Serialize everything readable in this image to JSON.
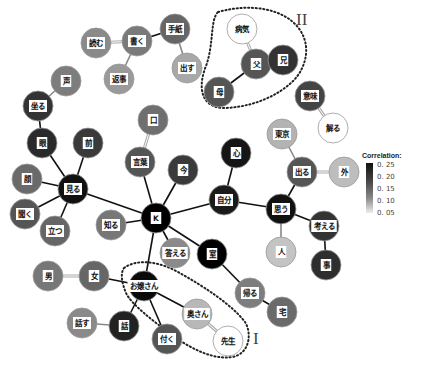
{
  "diagram": {
    "type": "co-occurrence network",
    "nodes": [
      {
        "id": "yomu",
        "label": "読む",
        "x": 96,
        "y": 43,
        "r": 15,
        "fill": "#8a8a8a"
      },
      {
        "id": "kaku",
        "label": "書く",
        "x": 137,
        "y": 41,
        "r": 15,
        "fill": "#7a7a7a"
      },
      {
        "id": "tegami",
        "label": "手紙",
        "x": 175,
        "y": 29,
        "r": 15,
        "fill": "#666"
      },
      {
        "id": "dasu",
        "label": "出す",
        "x": 187,
        "y": 68,
        "r": 15,
        "fill": "#a8a8a8"
      },
      {
        "id": "henji",
        "label": "返事",
        "x": 119,
        "y": 79,
        "r": 15,
        "fill": "#9a9a9a"
      },
      {
        "id": "koe",
        "label": "声",
        "x": 66,
        "y": 81,
        "r": 15,
        "fill": "#7d7d7d"
      },
      {
        "id": "suwaru",
        "label": "坐る",
        "x": 38,
        "y": 106,
        "r": 15,
        "fill": "#333"
      },
      {
        "id": "me",
        "label": "眼",
        "x": 42,
        "y": 143,
        "r": 15,
        "fill": "#2a2a2a"
      },
      {
        "id": "mae",
        "label": "前",
        "x": 88,
        "y": 143,
        "r": 15,
        "fill": "#3a3a3a"
      },
      {
        "id": "kao",
        "label": "顔",
        "x": 27,
        "y": 179,
        "r": 15,
        "fill": "#6a6a6a"
      },
      {
        "id": "miru",
        "label": "見る",
        "x": 73,
        "y": 189,
        "r": 15,
        "fill": "#111"
      },
      {
        "id": "kiku",
        "label": "聞く",
        "x": 25,
        "y": 214,
        "r": 15,
        "fill": "#555"
      },
      {
        "id": "tatsu",
        "label": "立つ",
        "x": 55,
        "y": 231,
        "r": 15,
        "fill": "#666"
      },
      {
        "id": "kuchi",
        "label": "口",
        "x": 153,
        "y": 120,
        "r": 15,
        "fill": "#6f6f6f"
      },
      {
        "id": "kotoba",
        "label": "言葉",
        "x": 140,
        "y": 162,
        "r": 15,
        "fill": "#555"
      },
      {
        "id": "ima",
        "label": "今",
        "x": 183,
        "y": 170,
        "r": 15,
        "fill": "#3a3a3a"
      },
      {
        "id": "shiru",
        "label": "知る",
        "x": 111,
        "y": 225,
        "r": 15,
        "fill": "#777"
      },
      {
        "id": "K",
        "label": "K",
        "x": 156,
        "y": 218,
        "r": 15,
        "fill": "#000"
      },
      {
        "id": "kotaeru",
        "label": "答える",
        "x": 175,
        "y": 253,
        "r": 15,
        "fill": "#8a8a8a"
      },
      {
        "id": "kokoro",
        "label": "心",
        "x": 236,
        "y": 153,
        "r": 15,
        "fill": "#151515"
      },
      {
        "id": "jibun",
        "label": "自分",
        "x": 224,
        "y": 200,
        "r": 15,
        "fill": "#1a1a1a"
      },
      {
        "id": "tokyo",
        "label": "東京",
        "x": 282,
        "y": 134,
        "r": 15,
        "fill": "#b3b3b3"
      },
      {
        "id": "deru",
        "label": "出る",
        "x": 302,
        "y": 172,
        "r": 15,
        "fill": "#555"
      },
      {
        "id": "soto",
        "label": "外",
        "x": 344,
        "y": 172,
        "r": 15,
        "fill": "#bdbdbd"
      },
      {
        "id": "omou",
        "label": "思う",
        "x": 281,
        "y": 209,
        "r": 15,
        "fill": "#111"
      },
      {
        "id": "hito",
        "label": "人",
        "x": 281,
        "y": 252,
        "r": 15,
        "fill": "#c4c4c4"
      },
      {
        "id": "kangaeru",
        "label": "考える",
        "x": 324,
        "y": 226,
        "r": 15,
        "fill": "#333"
      },
      {
        "id": "koto",
        "label": "事",
        "x": 326,
        "y": 265,
        "r": 15,
        "fill": "#2e2e2e"
      },
      {
        "id": "shitsu",
        "label": "室",
        "x": 212,
        "y": 254,
        "r": 15,
        "fill": "#000"
      },
      {
        "id": "kaeru",
        "label": "帰る",
        "x": 250,
        "y": 293,
        "r": 15,
        "fill": "#7d7d7d"
      },
      {
        "id": "taku",
        "label": "宅",
        "x": 282,
        "y": 312,
        "r": 15,
        "fill": "#6a6a6a"
      },
      {
        "id": "otoko",
        "label": "男",
        "x": 48,
        "y": 276,
        "r": 15,
        "fill": "#777"
      },
      {
        "id": "onna",
        "label": "女",
        "x": 94,
        "y": 276,
        "r": 15,
        "fill": "#666"
      },
      {
        "id": "ojousan",
        "label": "お嬢さん",
        "x": 144,
        "y": 286,
        "r": 15,
        "fill": "#0a0a0a"
      },
      {
        "id": "hanasu",
        "label": "話す",
        "x": 82,
        "y": 323,
        "r": 15,
        "fill": "#8a8a8a"
      },
      {
        "id": "hanashi",
        "label": "話",
        "x": 124,
        "y": 326,
        "r": 15,
        "fill": "#222"
      },
      {
        "id": "tsuku",
        "label": "付く",
        "x": 167,
        "y": 339,
        "r": 15,
        "fill": "#555"
      },
      {
        "id": "okusan",
        "label": "奥さん",
        "x": 197,
        "y": 314,
        "r": 15,
        "fill": "#b8b8b8"
      },
      {
        "id": "sensei",
        "label": "先生",
        "x": 228,
        "y": 341,
        "r": 15,
        "fill": "#fff"
      },
      {
        "id": "byouki",
        "label": "病気",
        "x": 242,
        "y": 29,
        "r": 15,
        "fill": "#fff"
      },
      {
        "id": "chichi",
        "label": "父",
        "x": 256,
        "y": 64,
        "r": 15,
        "fill": "#555"
      },
      {
        "id": "ani",
        "label": "兄",
        "x": 283,
        "y": 60,
        "r": 15,
        "fill": "#333"
      },
      {
        "id": "haha",
        "label": "母",
        "x": 219,
        "y": 92,
        "r": 15,
        "fill": "#555"
      },
      {
        "id": "imi",
        "label": "意味",
        "x": 310,
        "y": 96,
        "r": 15,
        "fill": "#444"
      },
      {
        "id": "wakaru",
        "label": "解る",
        "x": 333,
        "y": 128,
        "r": 15,
        "fill": "#fff"
      }
    ],
    "edges": [
      {
        "a": "yomu",
        "b": "kaku",
        "style": "light"
      },
      {
        "a": "kaku",
        "b": "tegami",
        "style": "dark"
      },
      {
        "a": "tegami",
        "b": "dasu",
        "style": "mid"
      },
      {
        "a": "kaku",
        "b": "henji",
        "style": "mid"
      },
      {
        "a": "koe",
        "b": "suwaru",
        "style": "mid"
      },
      {
        "a": "suwaru",
        "b": "me",
        "style": "dark"
      },
      {
        "a": "me",
        "b": "miru",
        "style": "dark"
      },
      {
        "a": "mae",
        "b": "miru",
        "style": "dark"
      },
      {
        "a": "kao",
        "b": "miru",
        "style": "dark"
      },
      {
        "a": "kiku",
        "b": "miru",
        "style": "dark"
      },
      {
        "a": "tatsu",
        "b": "miru",
        "style": "dark"
      },
      {
        "a": "miru",
        "b": "K",
        "style": "dark"
      },
      {
        "a": "kuchi",
        "b": "kotoba",
        "style": "light"
      },
      {
        "a": "kotoba",
        "b": "K",
        "style": "dark"
      },
      {
        "a": "ima",
        "b": "K",
        "style": "dark"
      },
      {
        "a": "shiru",
        "b": "K",
        "style": "dark"
      },
      {
        "a": "K",
        "b": "kotaeru",
        "style": "dark"
      },
      {
        "a": "K",
        "b": "jibun",
        "style": "dark"
      },
      {
        "a": "K",
        "b": "shitsu",
        "style": "dark"
      },
      {
        "a": "K",
        "b": "ojousan",
        "style": "dark"
      },
      {
        "a": "kokoro",
        "b": "jibun",
        "style": "dark"
      },
      {
        "a": "jibun",
        "b": "omou",
        "style": "dark"
      },
      {
        "a": "tokyo",
        "b": "deru",
        "style": "mid"
      },
      {
        "a": "deru",
        "b": "soto",
        "style": "light"
      },
      {
        "a": "deru",
        "b": "omou",
        "style": "dark"
      },
      {
        "a": "omou",
        "b": "hito",
        "style": "mid"
      },
      {
        "a": "omou",
        "b": "kangaeru",
        "style": "dark"
      },
      {
        "a": "kangaeru",
        "b": "koto",
        "style": "dark"
      },
      {
        "a": "shitsu",
        "b": "kaeru",
        "style": "dark"
      },
      {
        "a": "kaeru",
        "b": "taku",
        "style": "dark"
      },
      {
        "a": "otoko",
        "b": "onna",
        "style": "light"
      },
      {
        "a": "onna",
        "b": "ojousan",
        "style": "dark"
      },
      {
        "a": "ojousan",
        "b": "hanashi",
        "style": "dark"
      },
      {
        "a": "hanasu",
        "b": "hanashi",
        "style": "mid"
      },
      {
        "a": "ojousan",
        "b": "tsuku",
        "style": "dark"
      },
      {
        "a": "ojousan",
        "b": "okusan",
        "style": "dark"
      },
      {
        "a": "okusan",
        "b": "sensei",
        "style": "light"
      },
      {
        "a": "byouki",
        "b": "chichi",
        "style": "light"
      },
      {
        "a": "chichi",
        "b": "ani",
        "style": "dark"
      },
      {
        "a": "chichi",
        "b": "haha",
        "style": "dark"
      },
      {
        "a": "imi",
        "b": "wakaru",
        "style": "light"
      }
    ],
    "groups": [
      {
        "label": "I",
        "label_x": 253,
        "label_y": 338
      },
      {
        "label": "II",
        "label_x": 296,
        "label_y": 12
      }
    ]
  },
  "legend": {
    "title": "Correlation:",
    "ticks": [
      "0. 25",
      "0. 20",
      "0. 15",
      "0. 10",
      "0. 05"
    ]
  }
}
